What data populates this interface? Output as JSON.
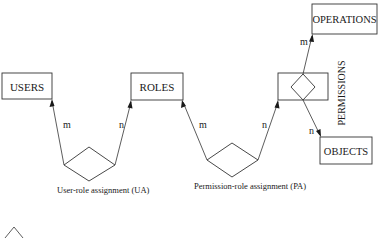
{
  "diagram": {
    "entities": {
      "users": "USERS",
      "roles": "ROLES",
      "operations": "OPERATIONS",
      "objects": "OBJECTS",
      "permissions": "PERMISSIONS"
    },
    "relationships": {
      "ua": "User-role  assignment  (UA)",
      "pa": "Permission-role  assignment  (PA)"
    },
    "cardinalities": {
      "ua_users": "m",
      "ua_roles": "n",
      "pa_roles": "m",
      "pa_permissions": "n",
      "perm_operations": "m",
      "perm_objects": "n"
    },
    "colors": {
      "stroke": "#333333",
      "text": "#1a1a1a",
      "background": "#ffffff"
    }
  }
}
